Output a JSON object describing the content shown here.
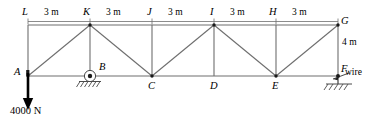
{
  "figure": {
    "type": "truss-free-body-diagram",
    "width": 366,
    "height": 121,
    "background_color": "#ffffff",
    "line_color": "#6e6e6e",
    "text_color": "#000000"
  },
  "nodes": {
    "top_chord": [
      {
        "id": "L",
        "label": "L"
      },
      {
        "id": "K",
        "label": "K"
      },
      {
        "id": "J",
        "label": "J"
      },
      {
        "id": "I",
        "label": "I"
      },
      {
        "id": "H",
        "label": "H"
      },
      {
        "id": "G",
        "label": "G"
      }
    ],
    "bottom_chord": [
      {
        "id": "A",
        "label": "A"
      },
      {
        "id": "B",
        "label": "B"
      },
      {
        "id": "C",
        "label": "C"
      },
      {
        "id": "D",
        "label": "D"
      },
      {
        "id": "E",
        "label": "E"
      },
      {
        "id": "F",
        "label": "F"
      }
    ]
  },
  "dimensions": {
    "top_spans": [
      {
        "between": "L-K",
        "label": "3 m"
      },
      {
        "between": "K-J",
        "label": "3 m"
      },
      {
        "between": "J-I",
        "label": "3 m"
      },
      {
        "between": "I-H",
        "label": "3 m"
      },
      {
        "between": "H-G",
        "label": "3 m"
      }
    ],
    "height": {
      "between": "G-F",
      "label": "4 m"
    }
  },
  "loads": [
    {
      "id": "load-at-A",
      "label": "4000 N",
      "magnitude": 4000,
      "unit": "N",
      "direction": "down",
      "applied_at": "A"
    }
  ],
  "supports": [
    {
      "id": "support-B",
      "at": "B",
      "type": "pin",
      "label": ""
    },
    {
      "id": "support-F",
      "at": "F",
      "type": "wire",
      "label": "wire"
    }
  ],
  "annotations": {
    "wire": "wire"
  }
}
